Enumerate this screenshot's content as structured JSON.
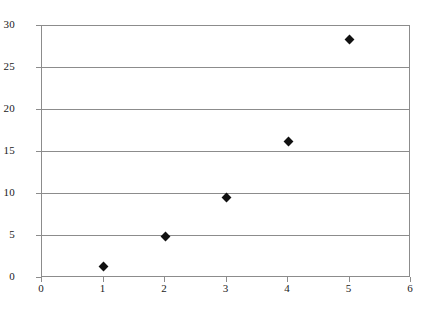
{
  "chart_data": {
    "type": "scatter",
    "title": "",
    "subtitle": "",
    "xlabel": "",
    "ylabel": "",
    "x": [
      1,
      2,
      3,
      4,
      5
    ],
    "values": [
      1.3,
      4.8,
      9.5,
      16.1,
      28.3
    ],
    "series": [
      {
        "name": "Series 1",
        "marker": "diamond",
        "color": "#111111",
        "points": [
          {
            "x": 1,
            "y": 1.3
          },
          {
            "x": 2,
            "y": 4.8
          },
          {
            "x": 3,
            "y": 9.5
          },
          {
            "x": 4,
            "y": 16.1
          },
          {
            "x": 5,
            "y": 28.3
          }
        ]
      }
    ],
    "xlim": [
      0,
      6
    ],
    "ylim": [
      0,
      30
    ],
    "xticks": [
      "0",
      "1",
      "2",
      "3",
      "4",
      "5",
      "6"
    ],
    "xtick_values": [
      0,
      1,
      2,
      3,
      4,
      5,
      6
    ],
    "yticks": [
      "0",
      "5",
      "10",
      "15",
      "20",
      "25",
      "30"
    ],
    "ytick_values": [
      0,
      5,
      10,
      15,
      20,
      25,
      30
    ],
    "grid": {
      "horizontal": true,
      "vertical": false,
      "color": "#8c8c8c"
    },
    "legend": {
      "visible": false,
      "position": "none",
      "entries": []
    },
    "annotations": [],
    "frame_color": "#8c8c8c",
    "background": "#ffffff"
  }
}
